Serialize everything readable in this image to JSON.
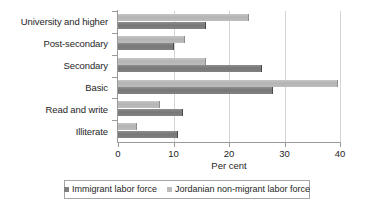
{
  "chart_data": {
    "type": "bar",
    "orientation": "horizontal",
    "title": "",
    "xlabel": "Per cent",
    "ylabel": "",
    "xlim": [
      0,
      40
    ],
    "xticks": [
      0,
      10,
      20,
      30,
      40
    ],
    "xtick_labels": [
      "0",
      "10",
      "20",
      "30",
      "40"
    ],
    "grid": true,
    "grid_axis": "x",
    "legend_position": "bottom",
    "categories": [
      "University and higher",
      "Post-secondary",
      "Secondary",
      "Basic",
      "Read and write",
      "Illiterate"
    ],
    "series": [
      {
        "name": "Immigrant labor force",
        "color": "#808080",
        "values": [
          15.9,
          10.0,
          26.0,
          28.0,
          11.7,
          10.8
        ]
      },
      {
        "name": "Jordanian non-migrant labor force",
        "color": "#bcbcbc",
        "values": [
          23.6,
          12.0,
          15.8,
          39.6,
          7.6,
          3.5
        ]
      }
    ]
  },
  "legend": {
    "entries": [
      {
        "label": "Immigrant labor force",
        "swatch": "dark"
      },
      {
        "label": "Jordanian non-migrant labor force",
        "swatch": "light"
      }
    ]
  },
  "axis": {
    "x_title": "Per cent"
  }
}
